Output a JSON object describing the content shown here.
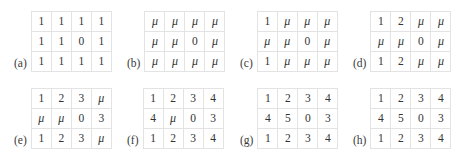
{
  "figure": {
    "title": "",
    "caption": "",
    "placeholder_symbol": "μ",
    "colors": {
      "background": "#ffffff",
      "grid_border": "#e3e3e3",
      "cell_text": "#333333",
      "label_text": "#3a3a3a"
    },
    "layout": {
      "columns": 4,
      "rows": 2,
      "matrix_rows": 3,
      "matrix_cols": 4
    }
  },
  "panels": [
    {
      "id": "a",
      "label": "(a)",
      "rows": [
        [
          "1",
          "1",
          "1",
          "1"
        ],
        [
          "1",
          "1",
          "0",
          "1"
        ],
        [
          "1",
          "1",
          "1",
          "1"
        ]
      ]
    },
    {
      "id": "b",
      "label": "(b)",
      "rows": [
        [
          "μ",
          "μ",
          "μ",
          "μ"
        ],
        [
          "μ",
          "μ",
          "0",
          "μ"
        ],
        [
          "μ",
          "μ",
          "μ",
          "μ"
        ]
      ]
    },
    {
      "id": "c",
      "label": "(c)",
      "rows": [
        [
          "1",
          "μ",
          "μ",
          "μ"
        ],
        [
          "μ",
          "μ",
          "0",
          "μ"
        ],
        [
          "1",
          "μ",
          "μ",
          "μ"
        ]
      ]
    },
    {
      "id": "d",
      "label": "(d)",
      "rows": [
        [
          "1",
          "2",
          "μ",
          "μ"
        ],
        [
          "μ",
          "μ",
          "0",
          "μ"
        ],
        [
          "1",
          "2",
          "μ",
          "μ"
        ]
      ]
    },
    {
      "id": "e",
      "label": "(e)",
      "rows": [
        [
          "1",
          "2",
          "3",
          "μ"
        ],
        [
          "μ",
          "μ",
          "0",
          "3"
        ],
        [
          "1",
          "2",
          "3",
          "μ"
        ]
      ]
    },
    {
      "id": "f",
      "label": "(f)",
      "rows": [
        [
          "1",
          "2",
          "3",
          "4"
        ],
        [
          "4",
          "μ",
          "0",
          "3"
        ],
        [
          "1",
          "2",
          "3",
          "4"
        ]
      ]
    },
    {
      "id": "g",
      "label": "(g)",
      "rows": [
        [
          "1",
          "2",
          "3",
          "4"
        ],
        [
          "4",
          "5",
          "0",
          "3"
        ],
        [
          "1",
          "2",
          "3",
          "4"
        ]
      ]
    },
    {
      "id": "h",
      "label": "(h)",
      "rows": [
        [
          "1",
          "2",
          "3",
          "4"
        ],
        [
          "4",
          "5",
          "0",
          "3"
        ],
        [
          "1",
          "2",
          "3",
          "4"
        ]
      ]
    }
  ]
}
